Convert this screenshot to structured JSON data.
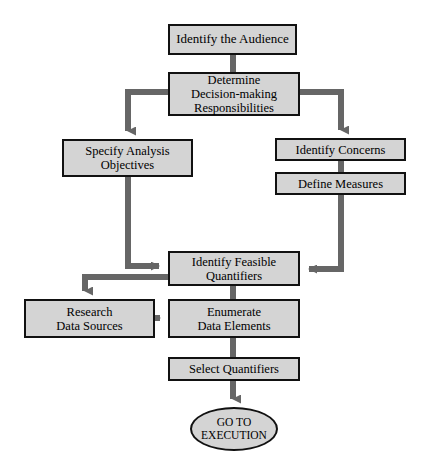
{
  "diagram": {
    "background_color": "#ffffff",
    "node_fill_color": "#d4d4d4",
    "node_border_color": "#111111",
    "connector_color": "#666666",
    "nodes": [
      {
        "id": "identify-audience",
        "label": "Identify the Audience",
        "shape": "rect",
        "x": 168,
        "y": 24,
        "w": 129,
        "h": 31,
        "font_size": 13
      },
      {
        "id": "determine-responsibilities",
        "label": "Determine\nDecision-making\nResponsibilities",
        "shape": "rect",
        "x": 168,
        "y": 72,
        "w": 132,
        "h": 44,
        "font_size": 12.5
      },
      {
        "id": "specify-analysis-objectives",
        "label": "Specify Analysis\nObjectives",
        "shape": "rect",
        "x": 62,
        "y": 139,
        "w": 131,
        "h": 38,
        "font_size": 12.5
      },
      {
        "id": "identify-concerns",
        "label": "Identify Concerns",
        "shape": "rect",
        "x": 275,
        "y": 138,
        "w": 131,
        "h": 23,
        "font_size": 12.5
      },
      {
        "id": "define-measures",
        "label": "Define Measures",
        "shape": "rect",
        "x": 275,
        "y": 172,
        "w": 131,
        "h": 23,
        "font_size": 12.5
      },
      {
        "id": "identify-feasible-quantifiers",
        "label": "Identify Feasible\nQuantifiers",
        "shape": "rect",
        "x": 168,
        "y": 251,
        "w": 132,
        "h": 35,
        "font_size": 12.5
      },
      {
        "id": "research-data-sources",
        "label": "Research\nData Sources",
        "shape": "rect",
        "x": 24,
        "y": 299,
        "w": 131,
        "h": 39,
        "font_size": 12.5
      },
      {
        "id": "enumerate-data-elements",
        "label": "Enumerate\nData Elements",
        "shape": "rect",
        "x": 168,
        "y": 299,
        "w": 132,
        "h": 39,
        "font_size": 12.5
      },
      {
        "id": "select-quantifiers",
        "label": "Select Quantifiers",
        "shape": "rect",
        "x": 168,
        "y": 357,
        "w": 132,
        "h": 24,
        "font_size": 12.5
      },
      {
        "id": "go-to-execution",
        "label": "GO TO\nEXECUTION",
        "shape": "ellipse",
        "x": 190,
        "y": 407,
        "w": 88,
        "h": 44,
        "font_size": 11.5
      }
    ],
    "edges": [
      {
        "id": "audience-to-determine",
        "from": "identify-audience",
        "to": "determine-responsibilities",
        "arrow": false
      },
      {
        "id": "determine-to-specify",
        "from": "determine-responsibilities",
        "to": "specify-analysis-objectives",
        "arrow": true
      },
      {
        "id": "determine-to-concerns",
        "from": "determine-responsibilities",
        "to": "identify-concerns",
        "arrow": true
      },
      {
        "id": "concerns-to-measures",
        "from": "identify-concerns",
        "to": "define-measures",
        "arrow": false
      },
      {
        "id": "specify-to-feasible",
        "from": "specify-analysis-objectives",
        "to": "identify-feasible-quantifiers",
        "arrow": true
      },
      {
        "id": "measures-to-feasible",
        "from": "define-measures",
        "to": "identify-feasible-quantifiers",
        "arrow": true
      },
      {
        "id": "feasible-to-research",
        "from": "identify-feasible-quantifiers",
        "to": "research-data-sources",
        "arrow": true
      },
      {
        "id": "feasible-to-enumerate",
        "from": "identify-feasible-quantifiers",
        "to": "enumerate-data-elements",
        "arrow": false
      },
      {
        "id": "research-to-enumerate",
        "from": "research-data-sources",
        "to": "enumerate-data-elements",
        "arrow": true
      },
      {
        "id": "enumerate-to-select",
        "from": "enumerate-data-elements",
        "to": "select-quantifiers",
        "arrow": false
      },
      {
        "id": "select-to-execution",
        "from": "select-quantifiers",
        "to": "go-to-execution",
        "arrow": true
      }
    ]
  }
}
